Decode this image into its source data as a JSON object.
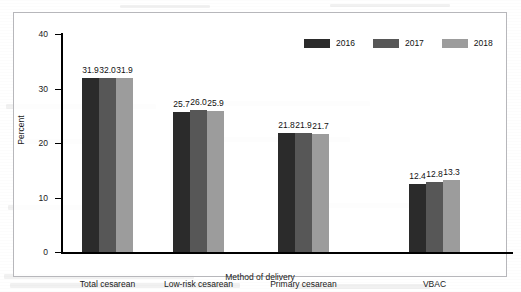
{
  "chart_data": {
    "type": "bar",
    "title": "",
    "subtitle": "",
    "xlabel": "Method of delivery",
    "ylabel": "Percent",
    "categories": [
      "Total cesarean",
      "Low-risk cesarean",
      "Primary cesarean",
      "VBAC"
    ],
    "series": [
      {
        "name": "2016",
        "color": "#2b2b2b",
        "values": [
          31.9,
          25.7,
          21.8,
          12.4
        ]
      },
      {
        "name": "2017",
        "color": "#575757",
        "values": [
          32.0,
          26.0,
          21.9,
          12.8
        ]
      },
      {
        "name": "2018",
        "color": "#9c9c9c",
        "values": [
          31.9,
          25.9,
          21.7,
          13.3
        ]
      }
    ],
    "value_labels": [
      [
        "31.9",
        "32.0",
        "31.9"
      ],
      [
        "25.7",
        "26.0",
        "25.9"
      ],
      [
        "21.8",
        "21.9",
        "21.7"
      ],
      [
        "12.4",
        "12.8",
        "13.3"
      ]
    ],
    "ylim": [
      0,
      40
    ],
    "yticks": [
      0,
      10,
      20,
      30,
      40
    ],
    "ytick_labels": [
      "0",
      "10",
      "20",
      "30",
      "40"
    ],
    "grid": false,
    "legend_position": "top-right",
    "legend_entries": [
      "2016",
      "2017",
      "2018"
    ]
  },
  "axes": {
    "y_title": "Percent",
    "x_title": "Method of delivery",
    "y_tick_labels": [
      "40",
      "30",
      "20",
      "10",
      "0"
    ]
  },
  "legend": {
    "items": [
      {
        "label": "2016",
        "color": "#2b2b2b"
      },
      {
        "label": "2017",
        "color": "#575757"
      },
      {
        "label": "2018",
        "color": "#9c9c9c"
      }
    ]
  },
  "colors": {
    "series_2016": "#2b2b2b",
    "series_2017": "#575757",
    "series_2018": "#9c9c9c",
    "axis": "#000000",
    "frame": "#b7b7bb",
    "background": "#ffffff"
  }
}
